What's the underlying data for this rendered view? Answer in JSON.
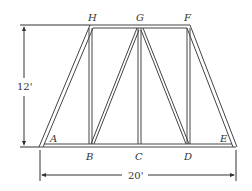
{
  "diagram": {
    "type": "truss",
    "nodes": {
      "A": "A",
      "B": "B",
      "C": "C",
      "D": "D",
      "E": "E",
      "F": "F",
      "G": "G",
      "H": "H"
    },
    "dimensions": {
      "height": "12'",
      "width": "20'"
    },
    "colors": {
      "stroke": "#333333",
      "background": "#ffffff"
    }
  }
}
